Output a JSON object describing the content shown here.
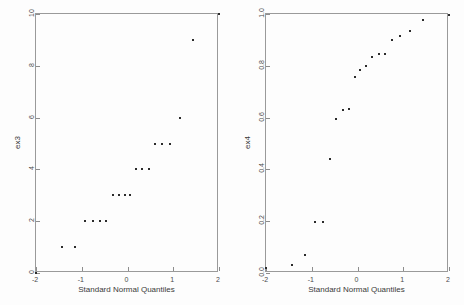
{
  "figure": {
    "background_color": "#fdfdfd",
    "frame_color": "#9a9a9a",
    "marker_color": "#2b2b2b",
    "text_color": "#3a3a3a"
  },
  "chart_data": [
    {
      "type": "scatter",
      "name": "qq-plot-ex3",
      "title": "",
      "xlabel": "Standard Normal Quantiles",
      "ylabel": "ex3",
      "xlim": [
        -2,
        2
      ],
      "ylim": [
        0,
        10
      ],
      "xticks": [
        -2,
        -1,
        0,
        1,
        2
      ],
      "xticklabels": [
        "-2",
        "-1",
        "0",
        "1",
        "2"
      ],
      "yticks": [
        0,
        2,
        4,
        6,
        8,
        10
      ],
      "yticklabels": [
        "0",
        "2",
        "4",
        "6",
        "8",
        "10"
      ],
      "grid": false,
      "legend": null,
      "x": [
        -2.0,
        -1.44,
        -1.15,
        -0.93,
        -0.76,
        -0.6,
        -0.46,
        -0.32,
        -0.18,
        -0.06,
        0.06,
        0.18,
        0.32,
        0.46,
        0.6,
        0.76,
        0.93,
        1.15,
        1.44,
        2.0
      ],
      "y": [
        0,
        1,
        1,
        2,
        2,
        2,
        2,
        3,
        3,
        3,
        3,
        4,
        4,
        4,
        5,
        5,
        5,
        6,
        9,
        10
      ]
    },
    {
      "type": "scatter",
      "name": "qq-plot-ex4",
      "title": "",
      "xlabel": "Standard Normal Quantiles",
      "ylabel": "ex4",
      "xlim": [
        -2,
        2
      ],
      "ylim": [
        0.0,
        1.0
      ],
      "xticks": [
        -2,
        -1,
        0,
        1,
        2
      ],
      "xticklabels": [
        "-2",
        "-1",
        "0",
        "1",
        "2"
      ],
      "yticks": [
        0.0,
        0.2,
        0.4,
        0.6,
        0.8,
        1.0
      ],
      "yticklabels": [
        "0.0",
        "0.2",
        "0.4",
        "0.6",
        "0.8",
        "1.0"
      ],
      "grid": false,
      "legend": null,
      "x": [
        -2.0,
        -1.44,
        -1.15,
        -0.93,
        -0.76,
        -0.6,
        -0.46,
        -0.32,
        -0.18,
        -0.06,
        0.06,
        0.18,
        0.32,
        0.46,
        0.6,
        0.76,
        0.93,
        1.15,
        1.44,
        2.0
      ],
      "y": [
        0.02,
        0.03,
        0.07,
        0.195,
        0.195,
        0.44,
        0.595,
        0.63,
        0.635,
        0.755,
        0.785,
        0.8,
        0.835,
        0.845,
        0.845,
        0.9,
        0.915,
        0.935,
        0.975,
        0.995,
        1.0
      ]
    }
  ]
}
